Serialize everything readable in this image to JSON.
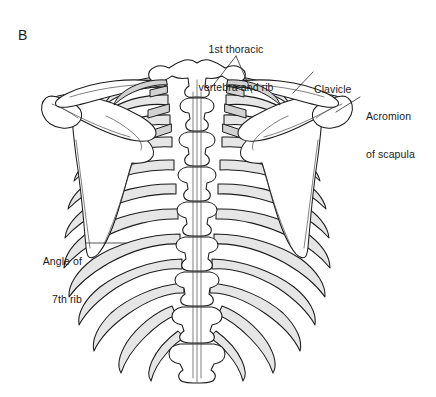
{
  "figure": {
    "panel_letter": "B",
    "view": "posterior view of thoracic skeleton",
    "background_color": "#ffffff",
    "line_color": "#1b1b1b",
    "bone_shade_color": "#e6e6e6",
    "bone_highlight_color": "#ffffff"
  },
  "labels": {
    "thoracic": {
      "line1": "1st thoracic",
      "line2": "vertebra and rib"
    },
    "clavicle": {
      "line1": "Clavicle"
    },
    "acromion": {
      "line1": "Acromion",
      "line2": "of scapula"
    },
    "rib_angle": {
      "line1": "Angle of",
      "line2": "7th rib"
    }
  },
  "structures": [
    {
      "name": "thoracic-vertebral-column",
      "count": 12,
      "fill": "#ffffff"
    },
    {
      "name": "rib",
      "count": 24,
      "fill": "#e6e6e6"
    },
    {
      "name": "left-scapula",
      "fill": "#ffffff"
    },
    {
      "name": "right-scapula",
      "fill": "#ffffff"
    },
    {
      "name": "left-clavicle",
      "fill": "#ffffff"
    },
    {
      "name": "right-clavicle",
      "fill": "#ffffff"
    },
    {
      "name": "left-acromion",
      "fill": "#ffffff"
    },
    {
      "name": "right-acromion",
      "fill": "#ffffff"
    }
  ]
}
